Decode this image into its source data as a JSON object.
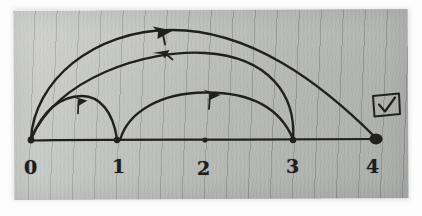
{
  "scene": {
    "medium": "photograph of a hand-drawn sketch on grey lined paper",
    "title": "Hand-drawn directed graph on a number line",
    "ink_color": "#22201f",
    "paper_color": "#c4c7c3",
    "border_color": "#ffffff"
  },
  "diagram": {
    "baseline_label": "horizontal number line",
    "nodes": [
      {
        "id": "n0",
        "label": "0",
        "x": 31,
        "y": 140,
        "style": "small-dot",
        "label_x": 24,
        "label_y": 158
      },
      {
        "id": "n1",
        "label": "1",
        "x": 117,
        "y": 140,
        "style": "small-dot",
        "label_x": 112,
        "label_y": 158
      },
      {
        "id": "n2",
        "label": "2",
        "x": 205,
        "y": 140,
        "style": "small-dot",
        "label_x": 197,
        "label_y": 158
      },
      {
        "id": "n3",
        "label": "3",
        "x": 293,
        "y": 140,
        "style": "small-dot",
        "label_x": 286,
        "label_y": 158
      },
      {
        "id": "n4",
        "label": "4",
        "x": 376,
        "y": 139,
        "style": "filled-large-dot",
        "label_x": 366,
        "label_y": 157
      }
    ],
    "edges": [
      {
        "id": "e01",
        "from": "0",
        "to": "1",
        "direction": "right",
        "arc": "low",
        "arrow_at": "mid"
      },
      {
        "id": "e13",
        "from": "1",
        "to": "3",
        "direction": "right",
        "arc": "mid",
        "arrow_at": "mid"
      },
      {
        "id": "e30",
        "from": "3",
        "to": "0",
        "direction": "left",
        "arc": "high",
        "arrow_at": "mid"
      },
      {
        "id": "e04",
        "from": "0",
        "to": "4",
        "direction": "right",
        "arc": "top",
        "arrow_at": "mid"
      }
    ],
    "checkbox": {
      "label": "",
      "checked": true,
      "x": 372,
      "y": 93,
      "width": 27,
      "height": 22
    }
  }
}
